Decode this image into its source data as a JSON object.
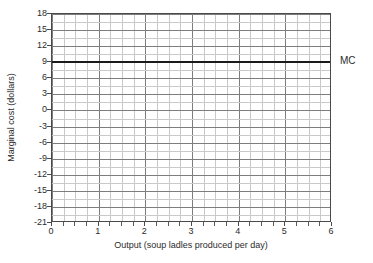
{
  "chart_data": {
    "type": "line",
    "title": "",
    "xlabel": "Output (soup ladles produced per day)",
    "ylabel": "Marginal cost (dollars)",
    "xlim": [
      0,
      6
    ],
    "ylim": [
      -21,
      18
    ],
    "xticks": [
      0,
      1,
      2,
      3,
      4,
      5,
      6
    ],
    "xtick_labels": [
      "0",
      "1",
      "2",
      "3",
      "4",
      "5",
      "6"
    ],
    "yticks": [
      18,
      15,
      12,
      9,
      6,
      3,
      0,
      -3,
      -6,
      -9,
      -12,
      -15,
      -18,
      -21
    ],
    "ytick_labels": [
      "18",
      "15",
      "12",
      "9",
      "6",
      "3",
      "0",
      "-3",
      "-6",
      "-9",
      "-12",
      "-15",
      "-18",
      "-21"
    ],
    "grid": true,
    "grid_minor_x_step": 0.25,
    "grid_minor_y_step": 1.5,
    "legend_position": "right-of-axes",
    "series": [
      {
        "name": "MC",
        "label": "MC",
        "color": "#1a1a1a",
        "constant_value": 9,
        "x": [
          0,
          1,
          2,
          3,
          4,
          5,
          6
        ],
        "values": [
          9,
          9,
          9,
          9,
          9,
          9,
          9
        ]
      }
    ],
    "annotations": [
      {
        "text": "MC",
        "x": 6,
        "y": 9,
        "placement": "right"
      }
    ]
  },
  "axes": {
    "y_title": "Marginal cost (dollars)",
    "x_title": "Output (soup ladles produced per day)"
  },
  "colors": {
    "series_line": "#1a1a1a",
    "grid_major": "#7d7d7d",
    "grid_minor": "#c9c9c9",
    "axis_border": "#4a4a4a",
    "text": "#2b2b2b",
    "background": "#ffffff"
  }
}
